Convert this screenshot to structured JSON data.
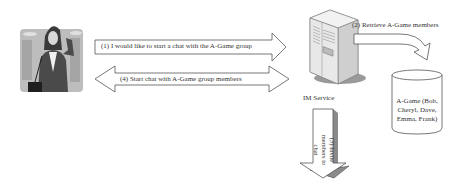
{
  "diagram": {
    "user": {
      "icon": "woman-on-phone-icon"
    },
    "server": {
      "icon": "server-tower-icon",
      "label": "IM Service"
    },
    "database": {
      "icon": "database-cylinder-icon",
      "label_lines": [
        "A-Game (Bob,",
        "Cheryl, Dave,",
        "Emma, Frank)"
      ]
    },
    "steps": {
      "s1": "(1) I would like to start a chat with the A-Game group",
      "s2": "(2) Retrieve A-Game members",
      "s3_lines": [
        "(3) Invite",
        "members to chat"
      ],
      "s4": "(4) Start chat with A-Game group members"
    },
    "colors": {
      "outline": "#555555",
      "server_body": "#e6e6e6",
      "server_shadow": "#9a9a9a",
      "photo_bg": "#b8b8b8"
    }
  }
}
